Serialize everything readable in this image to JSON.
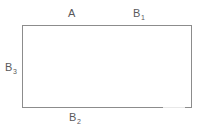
{
  "figure": {
    "type": "rectangle-diagram",
    "background_color": "#ffffff",
    "stroke_color": "#8c8c8c",
    "text_color": "#59595b",
    "labels": {
      "top_left": {
        "base": "A",
        "subscript": ""
      },
      "top_right": {
        "base": "B",
        "subscript": "1"
      },
      "left": {
        "base": "B",
        "subscript": "3"
      },
      "bottom": {
        "base": "B",
        "subscript": "2"
      }
    }
  }
}
